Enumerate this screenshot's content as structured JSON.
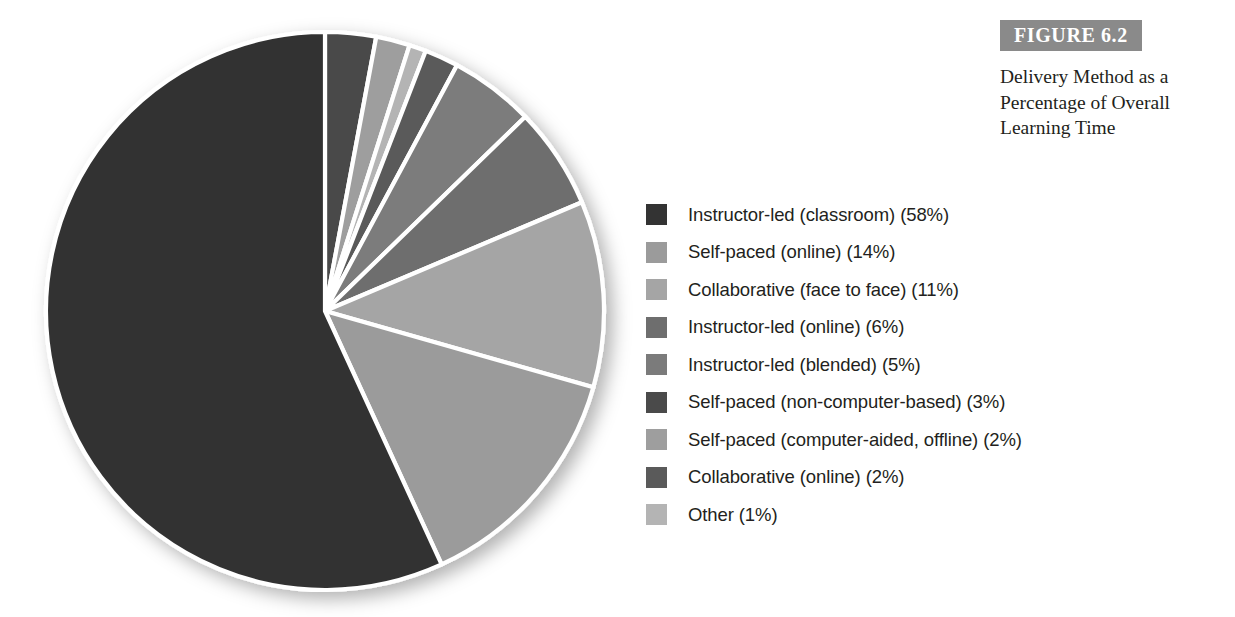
{
  "figure": {
    "tag": "FIGURE 6.2",
    "caption": "Delivery Method as a Percentage of Overall Learning Time"
  },
  "colors": {
    "figure_tag_background": "#8a8a8a",
    "figure_tag_text": "#ffffff",
    "text": "#231f20",
    "page_background": "#ffffff",
    "slice_separator": "#ffffff"
  },
  "chart_data": {
    "type": "pie",
    "title": "Delivery Method as a Percentage of Overall Learning Time",
    "xlabel": "",
    "ylabel": "",
    "unit": "%",
    "legend_position": "right",
    "grid": false,
    "start_angle_deg": 0,
    "direction": "clockwise",
    "categories": [
      "Instructor-led (classroom)",
      "Self-paced (online)",
      "Collaborative (face to face)",
      "Instructor-led (online)",
      "Instructor-led (blended)",
      "Self-paced (non-computer-based)",
      "Self-paced (computer-aided, offline)",
      "Collaborative (online)",
      "Other"
    ],
    "values": [
      58,
      14,
      11,
      6,
      5,
      3,
      2,
      2,
      1
    ],
    "colors": [
      "#333333",
      "#9b9b9b",
      "#a5a5a5",
      "#6e6e6e",
      "#7b7b7b",
      "#4a4a4a",
      "#9e9e9e",
      "#5a5a5a",
      "#b4b4b4"
    ],
    "legend_entries": [
      {
        "label": "Instructor-led (classroom) (58%)",
        "color": "#333333",
        "value": 58
      },
      {
        "label": "Self-paced (online) (14%)",
        "color": "#9b9b9b",
        "value": 14
      },
      {
        "label": "Collaborative (face to face) (11%)",
        "color": "#a5a5a5",
        "value": 11
      },
      {
        "label": "Instructor-led (online) (6%)",
        "color": "#6e6e6e",
        "value": 6
      },
      {
        "label": "Instructor-led (blended) (5%)",
        "color": "#7b7b7b",
        "value": 5
      },
      {
        "label": "Self-paced (non-computer-based) (3%)",
        "color": "#4a4a4a",
        "value": 3
      },
      {
        "label": "Self-paced (computer-aided, offline) (2%)",
        "color": "#9e9e9e",
        "value": 2
      },
      {
        "label": "Collaborative (online) (2%)",
        "color": "#5a5a5a",
        "value": 2
      },
      {
        "label": "Other (1%)",
        "color": "#b4b4b4",
        "value": 1
      }
    ],
    "draw_order_clockwise_from_top": [
      {
        "label": "Self-paced (non-computer-based)",
        "value": 3,
        "color": "#4a4a4a"
      },
      {
        "label": "Self-paced (computer-aided, offline)",
        "value": 2,
        "color": "#9e9e9e"
      },
      {
        "label": "Other",
        "value": 1,
        "color": "#b4b4b4"
      },
      {
        "label": "Collaborative (online)",
        "value": 2,
        "color": "#5a5a5a"
      },
      {
        "label": "Instructor-led (blended)",
        "value": 5,
        "color": "#7b7b7b"
      },
      {
        "label": "Instructor-led (online)",
        "value": 6,
        "color": "#6e6e6e"
      },
      {
        "label": "Collaborative (face to face)",
        "value": 11,
        "color": "#a5a5a5"
      },
      {
        "label": "Self-paced (online)",
        "value": 14,
        "color": "#9b9b9b"
      },
      {
        "label": "Instructor-led (classroom)",
        "value": 58,
        "color": "#333333"
      }
    ],
    "geometry": {
      "center_x": 325,
      "center_y": 311,
      "radius": 279
    }
  }
}
